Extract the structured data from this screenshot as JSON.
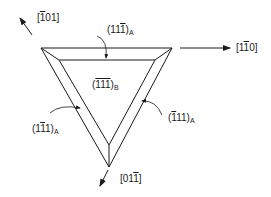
{
  "diagram": {
    "directions": {
      "up_left": {
        "pre": "[",
        "bar": "1",
        "post": "01]"
      },
      "right": {
        "pre": "[1",
        "bar": "1",
        "post": "0]"
      },
      "down": {
        "pre": "[01",
        "bar": "1",
        "post": "]"
      }
    },
    "faces": {
      "top": {
        "pre": "(11",
        "bar": "1",
        "post": ")",
        "sub": "A"
      },
      "center": {
        "pre": "(",
        "bar": "111",
        "post": ")",
        "sub": "B"
      },
      "left": {
        "pre": "(1",
        "bar": "1",
        "post": "1)",
        "sub": "A"
      },
      "right": {
        "pre": "(",
        "bar": "1",
        "post": "11)",
        "sub": "A"
      }
    },
    "colors": {
      "line": "#1a1a1a",
      "background": "#ffffff"
    }
  }
}
